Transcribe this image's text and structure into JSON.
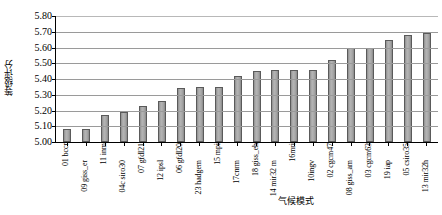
{
  "chart_data": {
    "type": "bar",
    "title": "",
    "xlabel": "气候模式",
    "ylabel": "等级评分",
    "ylim": [
      5.0,
      5.8
    ],
    "ytick_step": 0.1,
    "grid": true,
    "legend": false,
    "bar_color": "#9d9d9d",
    "bar_border_color": "#5a5a5a",
    "axis_color": "#000000",
    "gridline_color": "#9a9a9a",
    "ytick_labels": [
      "5.80",
      "5.70",
      "5.60",
      "5.50",
      "5.40",
      "5.30",
      "5.20",
      "5.10",
      "5.00"
    ],
    "ytick_values": [
      5.8,
      5.7,
      5.6,
      5.5,
      5.4,
      5.3,
      5.2,
      5.1,
      5.0
    ],
    "categories": [
      "01 bccr",
      "09 giss_er",
      "11 inm",
      "04c siro30",
      "07 gfdl21",
      "12 ipsl",
      "06 gfdl20",
      "23 hadgem",
      "15 mpi",
      "17cnrm",
      "18 giss_eh",
      "14 mir32 m",
      "16mri",
      "10ingv",
      "02 cgcm47",
      "08 giss_am",
      "03 cgcm63",
      "19 iap",
      "05 csiro35",
      "13 mir32h"
    ],
    "values": [
      5.08,
      5.08,
      5.17,
      5.19,
      5.23,
      5.26,
      5.34,
      5.35,
      5.35,
      5.42,
      5.45,
      5.46,
      5.46,
      5.46,
      5.52,
      5.6,
      5.6,
      5.65,
      5.68,
      5.69
    ]
  }
}
